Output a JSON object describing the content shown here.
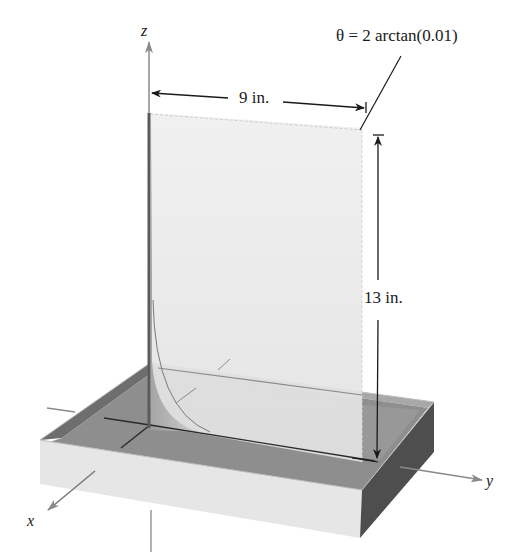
{
  "figure": {
    "axes": {
      "x_label": "x",
      "y_label": "y",
      "z_label": "z"
    },
    "annotations": {
      "angle": "θ = 2 arctan(0.01)",
      "sheet_width": "9 in.",
      "sheet_height": "13 in."
    },
    "colors": {
      "background": "#ffffff",
      "sheet": "#ececec",
      "tray_inner": "#8c8c8c",
      "tray_front": "#e6e6e6",
      "tray_side": "#505050",
      "tray_rim_left": "#6e6e6e",
      "axis": "#8a8a8a",
      "dimension_line": "#1a1a1a"
    }
  }
}
